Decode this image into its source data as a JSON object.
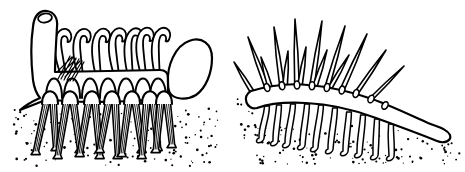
{
  "colors": {
    "ink": "#000000",
    "paper": "#ffffff"
  },
  "figures": {
    "left_creature": {
      "id": "stilt-spine-reconstruction",
      "tentacles": [
        [
          63,
          71.8,
          -6
        ],
        [
          80,
          71.5,
          -2
        ],
        [
          98,
          71.2,
          0
        ],
        [
          116,
          70.9,
          -3
        ],
        [
          130,
          70.7,
          1
        ],
        [
          143,
          70.4,
          -2
        ],
        [
          157,
          70.1,
          2
        ]
      ],
      "arches": [
        54,
        72,
        90,
        108,
        126,
        143,
        158
      ],
      "sockets": [
        50,
        70,
        92,
        112,
        132,
        150,
        164
      ],
      "leg_pairs": [
        [
          50,
          36,
          154,
          56,
          150
        ],
        [
          70,
          58,
          158,
          80,
          152
        ],
        [
          92,
          80,
          156,
          100,
          158
        ],
        [
          112,
          100,
          152,
          118,
          158
        ],
        [
          132,
          122,
          156,
          142,
          152
        ],
        [
          150,
          142,
          158,
          158,
          150
        ],
        [
          164,
          156,
          152,
          172,
          147
        ]
      ]
    },
    "right_creature": {
      "id": "dorsal-spine-reconstruction",
      "spine_bases": [
        [
          267,
          87.5,
          -18
        ],
        [
          282,
          85.8,
          -10
        ],
        [
          297,
          85,
          -4
        ],
        [
          312,
          85.8,
          2
        ],
        [
          327,
          87.5,
          8
        ],
        [
          342,
          90,
          14
        ],
        [
          356,
          93.5,
          20
        ],
        [
          371,
          99,
          26
        ],
        [
          385,
          105.5,
          30
        ]
      ],
      "spines": [
        [
          253,
          93,
          234,
          62
        ],
        [
          267,
          87.5,
          248,
          37
        ],
        [
          270,
          87,
          261,
          57
        ],
        [
          282,
          85.8,
          274,
          27
        ],
        [
          285,
          86,
          288,
          51
        ],
        [
          297,
          85,
          295,
          19
        ],
        [
          300,
          85,
          306,
          47
        ],
        [
          312,
          85.8,
          322,
          21
        ],
        [
          315,
          86,
          327,
          50
        ],
        [
          327,
          87.5,
          345,
          26
        ],
        [
          330,
          88,
          349,
          55
        ],
        [
          342,
          90,
          367,
          34
        ],
        [
          356,
          93.5,
          386,
          50
        ],
        [
          371,
          99,
          404,
          66
        ]
      ],
      "legs": [
        [
          267,
          106,
          262,
          140
        ],
        [
          279,
          105,
          276,
          143
        ],
        [
          293,
          104,
          288,
          145
        ],
        [
          307,
          104,
          303,
          147
        ],
        [
          321,
          105,
          316,
          149
        ],
        [
          335,
          108,
          331,
          151
        ],
        [
          349,
          112,
          346,
          153
        ],
        [
          363,
          115,
          360,
          155
        ],
        [
          377,
          119,
          376,
          157
        ],
        [
          391,
          124,
          392,
          158
        ]
      ]
    }
  },
  "stipple": {
    "seed": 7,
    "regions": [
      {
        "group": "ground-stipple-left",
        "x": 14,
        "y": 108,
        "w": 204,
        "h": 58,
        "count": 150
      },
      {
        "group": "ground-stipple-right",
        "x": 236,
        "y": 98,
        "w": 32,
        "h": 42,
        "count": 22
      },
      {
        "group": "ground-stipple-right",
        "x": 256,
        "y": 126,
        "w": 152,
        "h": 40,
        "count": 95
      },
      {
        "group": "ground-stipple-right",
        "x": 398,
        "y": 138,
        "w": 64,
        "h": 26,
        "count": 26
      }
    ]
  }
}
